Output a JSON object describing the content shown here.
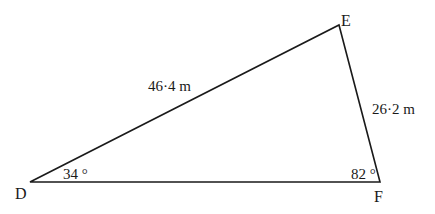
{
  "diagram": {
    "type": "triangle",
    "vertices": [
      {
        "name": "D",
        "label": "D"
      },
      {
        "name": "E",
        "label": "E"
      },
      {
        "name": "F",
        "label": "F"
      }
    ],
    "sides": {
      "DE": {
        "label": "46·4 m",
        "value": 46.4,
        "unit": "m"
      },
      "EF": {
        "label": "26·2 m",
        "value": 26.2,
        "unit": "m"
      }
    },
    "angles": {
      "D": {
        "label": "34 °",
        "value": 34
      },
      "F": {
        "label": "82 °",
        "value": 82
      }
    },
    "colors": {
      "stroke": "#1a1a1a",
      "background": "#ffffff"
    }
  }
}
